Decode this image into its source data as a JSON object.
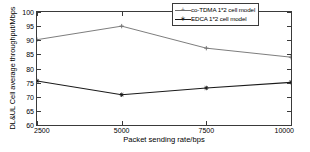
{
  "chart_data": {
    "type": "line",
    "title": "",
    "xlabel": "Packet sending rate/bps",
    "ylabel": "DL&UL Cell average throughput/Mbps",
    "x": [
      2500,
      5000,
      7500,
      10000
    ],
    "xticklabels": [
      "2500",
      "5000",
      "7500",
      "10000"
    ],
    "xlim": [
      2500,
      10000
    ],
    "ylim": [
      60,
      100
    ],
    "yticks": [
      60,
      65,
      70,
      75,
      80,
      85,
      90,
      95,
      100
    ],
    "yticklabels": [
      "60",
      "65",
      "70",
      "75",
      "80",
      "85",
      "90",
      "95",
      "100"
    ],
    "grid": false,
    "legend_position": "top-right",
    "series": [
      {
        "name": "co-TDMA 1*2 cell model",
        "values": [
          90.2,
          95.0,
          87.2,
          84.0
        ],
        "color": "#6e6e6e",
        "marker": "plus"
      },
      {
        "name": "EDCA 1*2 cell model",
        "values": [
          75.6,
          70.7,
          73.1,
          75.1
        ],
        "color": "#1a1a1a",
        "marker": "star"
      }
    ]
  },
  "legend": {
    "entries": [
      {
        "label": "co-TDMA 1*2 cell model",
        "marker": "+"
      },
      {
        "label": "EDCA 1*2 cell model",
        "marker": "∗"
      }
    ]
  }
}
